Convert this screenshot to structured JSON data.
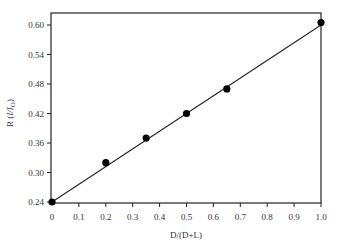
{
  "chart_data": {
    "type": "scatter",
    "title": "",
    "xlabel": "D/(D+L)",
    "ylabel": "R (I/I_O)",
    "ylabel_parts": {
      "prefix": "R (",
      "i1": "I",
      "slash": "/",
      "i2": "I",
      "sub": "O",
      "suffix": ")"
    },
    "xlim": [
      0,
      1.0
    ],
    "ylim": [
      0.24,
      0.62
    ],
    "xticks": [
      0,
      0.1,
      0.2,
      0.3,
      0.4,
      0.5,
      0.6,
      0.7,
      0.8,
      0.9,
      1.0
    ],
    "xtick_labels": [
      "0",
      "0.1",
      "0.2",
      "0.3",
      "0.4",
      "0.5",
      "0.6",
      "0.7",
      "0.8",
      "0.9",
      "1.0"
    ],
    "yticks": [
      0.24,
      0.3,
      0.36,
      0.42,
      0.48,
      0.54,
      0.6
    ],
    "ytick_labels": [
      "0.24",
      "0.30",
      "0.36",
      "0.42",
      "0.48",
      "0.54",
      "0.60"
    ],
    "grid": false,
    "legend": null,
    "series": [
      {
        "name": "measured",
        "marker": "filled-circle",
        "color": "#000000",
        "x": [
          0,
          0.2,
          0.35,
          0.5,
          0.65,
          1.0
        ],
        "y": [
          0.24,
          0.32,
          0.37,
          0.42,
          0.47,
          0.605
        ]
      },
      {
        "name": "linear fit",
        "line": "solid",
        "color": "#222222",
        "x": [
          0,
          1.0
        ],
        "y": [
          0.24,
          0.6
        ]
      }
    ]
  }
}
